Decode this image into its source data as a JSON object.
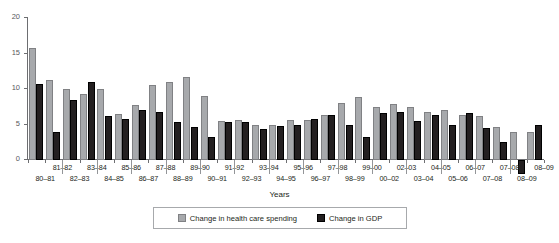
{
  "chart_data": {
    "type": "bar",
    "title": "",
    "xlabel": "Years",
    "ylabel": "",
    "ylim": [
      0,
      20
    ],
    "yticks": [
      0,
      5,
      10,
      15,
      20
    ],
    "grid": false,
    "legend_position": "bottom",
    "categories": [
      "80–81",
      "81–82",
      "82–83",
      "83–84",
      "84–85",
      "85–86",
      "86–87",
      "87–88",
      "88–89",
      "89–90",
      "90–91",
      "91–92",
      "92–93",
      "93–94",
      "94–95",
      "95–96",
      "96–97",
      "97–98",
      "98–99",
      "99–00",
      "00–02",
      "02–03",
      "03–04",
      "04–05",
      "05–06",
      "06–07",
      "07–08",
      "08–09",
      "09–10",
      "09–10"
    ],
    "series": [
      {
        "name": "Change in health care spending",
        "color": "#a7a9ac",
        "values": [
          15.8,
          11.3,
          10.0,
          9.3,
          10.0,
          6.5,
          7.7,
          10.5,
          11.0,
          11.7,
          9.0,
          5.5,
          5.7,
          5.0,
          5.0,
          5.6,
          5.6,
          6.4,
          8.1,
          8.9,
          7.4,
          7.9,
          7.5,
          6.8,
          7.0,
          6.4,
          6.2,
          4.7,
          4.0,
          4.0
        ]
      },
      {
        "name": "Change in GDP",
        "color": "#231f20",
        "values": [
          10.7,
          4.0,
          8.5,
          11.0,
          6.2,
          5.8,
          7.0,
          6.8,
          5.3,
          4.7,
          3.3,
          5.3,
          5.3,
          4.4,
          4.8,
          5.0,
          5.8,
          6.4,
          5.0,
          3.3,
          6.6,
          6.7,
          5.5,
          6.4,
          5.0,
          6.6,
          4.5,
          2.5,
          -2.0,
          5.0
        ]
      }
    ]
  },
  "axis": {
    "title": "Years",
    "ytick_labels": [
      "20",
      "15",
      "10",
      "5",
      "0"
    ],
    "xtick_labels_top": [
      "81–82",
      "83–84",
      "85–86",
      "87–88",
      "89–90",
      "91–92",
      "93–94",
      "95–96",
      "97–98",
      "99–00",
      "02–03",
      "04–05",
      "06–07",
      "07–08",
      "08–09",
      "09–10"
    ],
    "xtick_labels_bottom": [
      "80–81",
      "82–83",
      "84–85",
      "86–87",
      "88–89",
      "90–91",
      "92–93",
      "94–95",
      "96–97",
      "98–99",
      "00–02",
      "03–04",
      "05–06",
      "07–08",
      "08–09",
      "09–10"
    ]
  },
  "legend": {
    "items": [
      {
        "label": "Change in health care spending",
        "color": "#a7a9ac",
        "icon": "square-swatch-icon"
      },
      {
        "label": "Change in GDP",
        "color": "#231f20",
        "icon": "square-swatch-icon"
      }
    ]
  }
}
